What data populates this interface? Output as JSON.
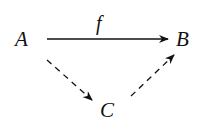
{
  "diagram": {
    "type": "commutative-diagram",
    "nodes": [
      {
        "id": "A",
        "label": "A"
      },
      {
        "id": "B",
        "label": "B"
      },
      {
        "id": "C",
        "label": "C"
      }
    ],
    "edges": [
      {
        "from": "A",
        "to": "B",
        "label": "f",
        "style": "solid"
      },
      {
        "from": "A",
        "to": "C",
        "label": "",
        "style": "dashed"
      },
      {
        "from": "C",
        "to": "B",
        "label": "",
        "style": "dashed"
      }
    ],
    "colors": {
      "stroke": "#111111",
      "background": "#ffffff"
    }
  }
}
